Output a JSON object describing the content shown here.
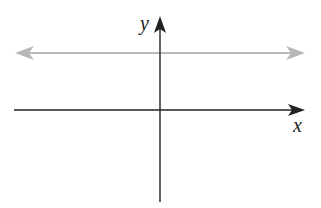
{
  "diagram": {
    "type": "coordinate-plane",
    "axes": {
      "x_label": "x",
      "y_label": "y",
      "color": "#222222"
    },
    "line": {
      "kind": "horizontal",
      "position": "above x-axis (y = positive constant)",
      "arrows": "both ends",
      "color": "#b8b8b8"
    }
  },
  "colors": {
    "background": "#ffffff",
    "axes": "#222222",
    "line": "#b8b8b8"
  }
}
